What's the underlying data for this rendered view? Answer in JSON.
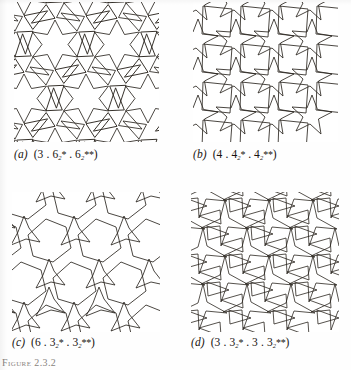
{
  "figure": {
    "page_label": "Figure 2.3.2",
    "background": "#ffffff",
    "ink_color": "#2b2620",
    "panels": [
      {
        "id": "a",
        "label": "(a)",
        "symbol_plain": "(3 . 6₂* . 6₂**)",
        "parts": [
          {
            "base": "3",
            "sub": "",
            "star": ""
          },
          {
            "base": "6",
            "sub": "2",
            "star": "*"
          },
          {
            "base": "6",
            "sub": "2",
            "star": "**"
          }
        ],
        "tiling": "hexagonal-star-and-triangle",
        "description": "six-pointed stars with triangles"
      },
      {
        "id": "b",
        "label": "(b)",
        "symbol_plain": "(4 . 4₂* . 4₂**)",
        "parts": [
          {
            "base": "4",
            "sub": "",
            "star": ""
          },
          {
            "base": "4",
            "sub": "2",
            "star": "*"
          },
          {
            "base": "4",
            "sub": "2",
            "star": "**"
          }
        ],
        "tiling": "square-star-and-square",
        "description": "four-pointed stars with squares"
      },
      {
        "id": "c",
        "label": "(c)",
        "symbol_plain": "(6 . 3₂* . 3₂**)",
        "parts": [
          {
            "base": "6",
            "sub": "",
            "star": ""
          },
          {
            "base": "3",
            "sub": "2",
            "star": "*"
          },
          {
            "base": "3",
            "sub": "2",
            "star": "**"
          }
        ],
        "tiling": "hexagon-and-three-pointed-star",
        "description": "hexagons with three-pointed pinwheel stars"
      },
      {
        "id": "d",
        "label": "(d)",
        "symbol_plain": "(3 . 3₂* . 3 . 3₂**)",
        "parts": [
          {
            "base": "3",
            "sub": "",
            "star": ""
          },
          {
            "base": "3",
            "sub": "2",
            "star": "*"
          },
          {
            "base": "3",
            "sub": "",
            "star": ""
          },
          {
            "base": "3",
            "sub": "2",
            "star": "**"
          }
        ],
        "tiling": "triangle-and-three-pointed-star",
        "description": "dense three-pointed stars and triangles"
      }
    ]
  }
}
